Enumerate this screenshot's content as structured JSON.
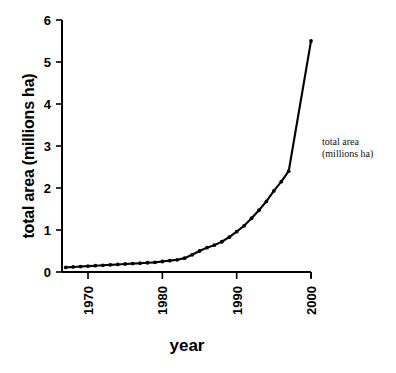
{
  "chart_data": {
    "type": "line",
    "title": "",
    "subtitle": "",
    "xlabel": "year",
    "ylabel": "total area (millions ha)",
    "xlim": [
      1966.5,
      2000
    ],
    "ylim": [
      0,
      6
    ],
    "grid": false,
    "legend_position": "right-annotation",
    "legend_entries": [
      "total area (millions ha)"
    ],
    "annotations": [
      {
        "text_line1": "total area",
        "text_line2": "(millions ha)",
        "x": 2001,
        "y": 2.75
      }
    ],
    "xticks": [
      1970,
      1980,
      1990,
      2000
    ],
    "xtick_labels": [
      "1970",
      "1980",
      "1990",
      "2000"
    ],
    "yticks": [
      0,
      1,
      2,
      3,
      4,
      5,
      6
    ],
    "ytick_labels": [
      "0",
      "1",
      "2",
      "3",
      "4",
      "5",
      "6"
    ],
    "marker": "filled-circle",
    "line_color": "#000000",
    "series": [
      {
        "name": "total area (millions ha)",
        "x": [
          1967,
          1968,
          1969,
          1970,
          1971,
          1972,
          1973,
          1974,
          1975,
          1976,
          1977,
          1978,
          1979,
          1980,
          1981,
          1982,
          1983,
          1984,
          1985,
          1986,
          1987,
          1988,
          1989,
          1990,
          1991,
          1992,
          1993,
          1994,
          1995,
          1996,
          1997,
          2000
        ],
        "values": [
          0.11,
          0.12,
          0.13,
          0.14,
          0.15,
          0.16,
          0.17,
          0.18,
          0.19,
          0.2,
          0.21,
          0.22,
          0.23,
          0.25,
          0.27,
          0.29,
          0.33,
          0.41,
          0.5,
          0.58,
          0.64,
          0.72,
          0.83,
          0.96,
          1.1,
          1.28,
          1.47,
          1.68,
          1.93,
          2.15,
          2.4,
          5.5
        ]
      }
    ]
  },
  "axis_titles": {
    "y": "total area (millions ha)",
    "x": "year"
  },
  "annotation": {
    "line1": "total area",
    "line2": "(millions ha)"
  },
  "colors": {
    "ink": "#000000",
    "background": "#ffffff"
  }
}
